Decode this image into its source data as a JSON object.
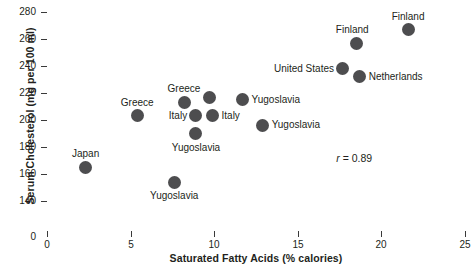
{
  "chart_data": {
    "type": "scatter",
    "title": "",
    "xlabel": "Saturated Fatty Acids (% calories)",
    "ylabel": "Serum Cholesterol (mg per 100 ml)",
    "xlim": [
      0,
      25
    ],
    "ylim": [
      140,
      280
    ],
    "y_axis_break": true,
    "y_zero_label": "0",
    "grid": false,
    "legend": "none",
    "xticks": [
      "0",
      "5",
      "10",
      "15",
      "20",
      "25"
    ],
    "xtick_values": [
      0,
      5,
      10,
      15,
      20,
      25
    ],
    "yticks": [
      "140",
      "160",
      "180",
      "200",
      "220",
      "240",
      "260",
      "280"
    ],
    "ytick_values": [
      140,
      160,
      180,
      200,
      220,
      240,
      260,
      280
    ],
    "annotations": [
      {
        "text_italic": "r",
        "text": " = 0.89",
        "x": 17.3,
        "y": 172
      }
    ],
    "marker_color": "#4d4d4f",
    "axis_color": "#3a3a3a",
    "points": [
      {
        "label": "Japan",
        "x": 2.3,
        "y": 165,
        "label_pos": "above"
      },
      {
        "label": "Greece",
        "x": 5.4,
        "y": 203,
        "label_pos": "above"
      },
      {
        "label": "Yugoslavia",
        "x": 7.6,
        "y": 154,
        "label_pos": "below"
      },
      {
        "label": "Greece",
        "x": 8.2,
        "y": 213,
        "label_pos": "above"
      },
      {
        "label": "Italy",
        "x": 8.9,
        "y": 203,
        "label_pos": "left"
      },
      {
        "label": "Yugoslavia",
        "x": 8.9,
        "y": 190,
        "label_pos": "below"
      },
      {
        "label": "Italy",
        "x": 9.9,
        "y": 203,
        "label_pos": "right"
      },
      {
        "label": "Yugoslavia",
        "x": 9.7,
        "y": 217,
        "label_pos": "none"
      },
      {
        "label": "Yugoslavia",
        "x": 11.7,
        "y": 215,
        "label_pos": "right"
      },
      {
        "label": "Yugoslavia",
        "x": 12.9,
        "y": 196,
        "label_pos": "right"
      },
      {
        "label": "United States",
        "x": 17.7,
        "y": 238,
        "label_pos": "left"
      },
      {
        "label": "Finland",
        "x": 18.5,
        "y": 257,
        "label_pos": "above-left"
      },
      {
        "label": "Netherlands",
        "x": 18.7,
        "y": 232,
        "label_pos": "right"
      },
      {
        "label": "Finland",
        "x": 21.6,
        "y": 267,
        "label_pos": "above"
      }
    ]
  }
}
